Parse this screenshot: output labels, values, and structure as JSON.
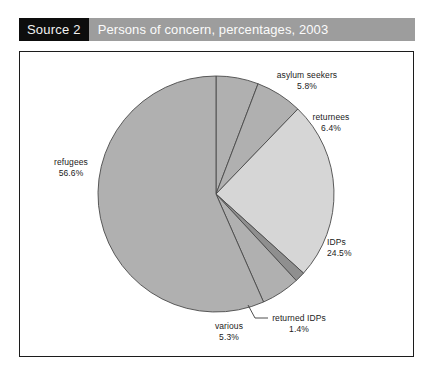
{
  "header": {
    "source_tag": "Source 2",
    "title": "Persons of concern, percentages, 2003"
  },
  "colors": {
    "source_tag_bg": "#0d0d0d",
    "source_tag_text": "#f2f2f2",
    "title_bar_bg": "#9d9d9d",
    "title_bar_text": "#fbfbfb",
    "frame_border": "#1c1c1c",
    "slice_medium_gray": "#b0b0b0",
    "slice_light_gray": "#d6d6d6",
    "slice_dark_gray": "#8f8f8f",
    "slice_outline": "#4a4a4a",
    "leader_line": "#3a3a3a",
    "label_text": "#1b1b1b",
    "page_bg": "#ffffff"
  },
  "chart_data": {
    "type": "pie",
    "title": "Persons of concern, percentages, 2003",
    "unit": "%",
    "legend": "none",
    "labels_placement": "outside-with-leader-lines",
    "start_angle_deg": 0,
    "direction": "clockwise",
    "categories": [
      "asylum seekers",
      "returnees",
      "IDPs",
      "returned IDPs",
      "various",
      "refugees"
    ],
    "values": [
      5.8,
      6.4,
      24.5,
      1.4,
      5.3,
      56.6
    ],
    "slices": [
      {
        "name": "asylum seekers",
        "label": "asylum seekers",
        "value": 5.8,
        "value_text": "5.8%",
        "color": "#b0b0b0"
      },
      {
        "name": "returnees",
        "label": "returnees",
        "value": 6.4,
        "value_text": "6.4%",
        "color": "#b0b0b0"
      },
      {
        "name": "IDPs",
        "label": "IDPs",
        "value": 24.5,
        "value_text": "24.5%",
        "color": "#d6d6d6"
      },
      {
        "name": "returned IDPs",
        "label": "returned IDPs",
        "value": 1.4,
        "value_text": "1.4%",
        "color": "#8f8f8f"
      },
      {
        "name": "various",
        "label": "various",
        "value": 5.3,
        "value_text": "5.3%",
        "color": "#b0b0b0"
      },
      {
        "name": "refugees",
        "label": "refugees",
        "value": 56.6,
        "value_text": "56.6%",
        "color": "#b0b0b0"
      }
    ],
    "total": 100.0,
    "geometry": {
      "cx": 216,
      "cy": 194,
      "r": 118
    }
  }
}
